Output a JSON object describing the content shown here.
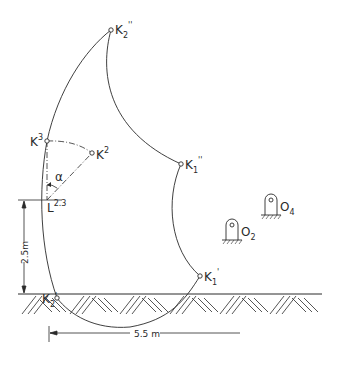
{
  "diagram": {
    "type": "kinematic-trajectory-diagram",
    "colors": {
      "line": "#2a2a2a",
      "background": "#ffffff"
    },
    "points": {
      "K2pp": {
        "base": "K",
        "sub": "2",
        "prime": "''"
      },
      "K3": {
        "base": "K",
        "sup": "3"
      },
      "K2": {
        "base": "K",
        "sup": "2"
      },
      "K1pp": {
        "base": "K",
        "sub": "1",
        "prime": "''"
      },
      "K1p": {
        "base": "K",
        "sub": "1",
        "prime": "'"
      },
      "K2p": {
        "base": "K",
        "sub": "2",
        "prime": "'"
      },
      "L23": {
        "base": "L",
        "sup": "2.3"
      }
    },
    "angle_label": "α",
    "pivots": [
      {
        "base": "O",
        "sub": "2"
      },
      {
        "base": "O",
        "sub": "4"
      }
    ],
    "dimensions": {
      "vertical": "2.5m",
      "horizontal": "5.5 m"
    },
    "ground": "hatched ground surface"
  }
}
